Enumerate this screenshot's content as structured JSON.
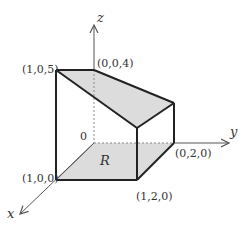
{
  "diagram": {
    "type": "3d-solid-region",
    "axes": {
      "x": "x",
      "y": "y",
      "z": "z"
    },
    "origin_label": "0",
    "region_label": "R",
    "points": {
      "p105": "(1,0,5)",
      "p004": "(0,0,4)",
      "p100": "(1,0,0)",
      "p120": "(1,2,0)",
      "p020": "(0,2,0)"
    },
    "colors": {
      "face_fill": "#dcdcdc",
      "edge": "#222222",
      "axis": "#555555",
      "hidden": "#888888"
    }
  }
}
